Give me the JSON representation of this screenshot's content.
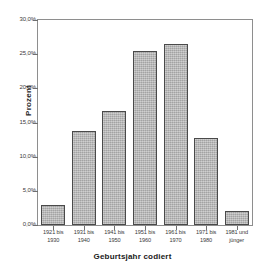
{
  "top_partial_title": "",
  "chart_data": {
    "type": "bar",
    "title": "",
    "xlabel": "Geburtsjahr codiert",
    "ylabel": "Prozent",
    "ylim": [
      0,
      30
    ],
    "ytick_labels": [
      "30,0%",
      "25,0%",
      "20,0%",
      "15,0%",
      "10,0%",
      "5,0%",
      "0,0%"
    ],
    "ytick_values": [
      30,
      25,
      20,
      15,
      10,
      5,
      0
    ],
    "grid": false,
    "legend": null,
    "bar_color": "#b3b3b3",
    "bar_edge_color": "#4a4a4a",
    "categories": [
      "1921 bis\n1930",
      "1931 bis\n1940",
      "1941 bis\n1950",
      "1951 bis\n1960",
      "1961 bis\n1970",
      "1971 bis\n1980",
      "1981 und\njünger"
    ],
    "category_lines": [
      [
        "1921 bis",
        "1930"
      ],
      [
        "1931 bis",
        "1940"
      ],
      [
        "1941 bis",
        "1950"
      ],
      [
        "1951 bis",
        "1960"
      ],
      [
        "1961 bis",
        "1970"
      ],
      [
        "1971 bis",
        "1980"
      ],
      [
        "1981 und",
        "jünger"
      ]
    ],
    "values": [
      2.9,
      13.7,
      16.7,
      25.5,
      26.5,
      12.8,
      2.1
    ]
  }
}
